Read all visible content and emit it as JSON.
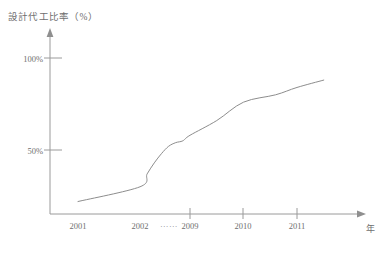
{
  "chart_data": {
    "type": "line",
    "title": "",
    "ylabel": "設計代工比率（%）",
    "xlabel": "年",
    "ylim": [
      0,
      110
    ],
    "xlim": [
      2000.4,
      2011.9
    ],
    "grid": false,
    "legend": null,
    "y_ticks": [
      {
        "value": 100,
        "label": "100%"
      },
      {
        "value": 50,
        "label": "50%"
      }
    ],
    "x_ticks": [
      {
        "value": 2001,
        "label": "2001",
        "tick_mark": false
      },
      {
        "value": 2002,
        "label": "2002",
        "tick_mark": false
      },
      {
        "value": 2009,
        "label": "2009",
        "tick_mark": true
      },
      {
        "value": 2010,
        "label": "2010",
        "tick_mark": true
      },
      {
        "value": 2011,
        "label": "2011",
        "tick_mark": true
      }
    ],
    "x_axis_break": "……",
    "series": [
      {
        "name": "設計代工比率",
        "color": "#8d8d8d",
        "x": [
          2001.0,
          2002.0,
          2003.0,
          2004.0,
          2005.0,
          2006.0,
          2007.0,
          2008.0,
          2009.0,
          2009.5,
          2010.0,
          2010.6,
          2011.0,
          2011.5
        ],
        "values": [
          22,
          30,
          37,
          43,
          48,
          52,
          54,
          55,
          58,
          66,
          76,
          80,
          84,
          88
        ]
      }
    ],
    "annotations": [
      {
        "text": "曲線在 2009 年附近出現平緩轉折",
        "visible": false
      }
    ]
  },
  "colors": {
    "axis": "#9a9a9a",
    "line": "#8d8d8d",
    "text": "#6f6f6f",
    "background": "#ffffff"
  },
  "axis_labels": {
    "y_title": "設計代工比率（%）",
    "x_unit": "年",
    "y_100": "100%",
    "y_50": "50%",
    "x_2001": "2001",
    "x_2002": "2002",
    "x_2009": "2009",
    "x_2010": "2010",
    "x_2011": "2011",
    "ellipsis": "……"
  }
}
